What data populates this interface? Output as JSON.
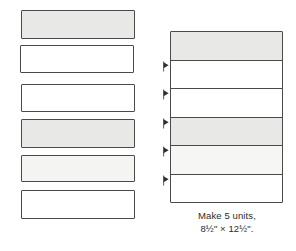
{
  "diagram": {
    "colors": {
      "outline": "#4a4a4a",
      "fill_medium_gray": "#e8e8e6",
      "fill_light_gray": "#f4f4f2",
      "fill_white": "#ffffff",
      "text": "#2b2b2b",
      "background": "#ffffff"
    },
    "loose_strips": {
      "label": "Cut fabric strips",
      "count": 6,
      "items": [
        {
          "index": 1,
          "shade": "medium-gray",
          "fill": "#e8e8e6",
          "x": 21,
          "y": 10,
          "w": 114,
          "h": 29
        },
        {
          "index": 2,
          "shade": "white",
          "fill": "#ffffff",
          "x": 20,
          "y": 45,
          "w": 114,
          "h": 28
        },
        {
          "index": 3,
          "shade": "white",
          "fill": "#ffffff",
          "x": 21,
          "y": 84,
          "w": 114,
          "h": 28
        },
        {
          "index": 4,
          "shade": "medium-gray",
          "fill": "#e8e8e6",
          "x": 21,
          "y": 119,
          "w": 114,
          "h": 29
        },
        {
          "index": 5,
          "shade": "light-gray",
          "fill": "#f4f4f2",
          "x": 21,
          "y": 155,
          "w": 114,
          "h": 27
        },
        {
          "index": 6,
          "shade": "white",
          "fill": "#ffffff",
          "x": 21,
          "y": 190,
          "w": 114,
          "h": 29
        }
      ]
    },
    "sewn_unit": {
      "label": "Assembled strip-pieced unit",
      "band_count": 6,
      "bands": [
        {
          "index": 1,
          "shade": "medium-gray",
          "fill": "#e8e8e6"
        },
        {
          "index": 2,
          "shade": "white",
          "fill": "#ffffff"
        },
        {
          "index": 3,
          "shade": "white",
          "fill": "#ffffff"
        },
        {
          "index": 4,
          "shade": "medium-gray",
          "fill": "#e8e8e6"
        },
        {
          "index": 5,
          "shade": "light-gray",
          "fill": "#f6f6f4"
        },
        {
          "index": 6,
          "shade": "white",
          "fill": "#ffffff"
        }
      ],
      "seam_arrows": {
        "label": "Seam allowance pressing direction",
        "count": 5,
        "direction": "right",
        "icon": "arrow-right-icon",
        "at_seam_indexes": [
          1,
          2,
          3,
          4,
          5
        ]
      }
    },
    "caption": {
      "line1": "Make 5 units,",
      "line2": "8½\" × 12½\"."
    }
  }
}
